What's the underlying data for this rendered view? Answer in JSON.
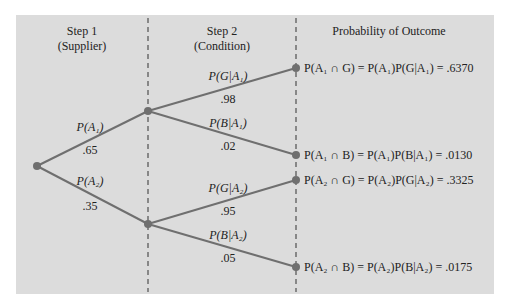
{
  "headers": {
    "step1": {
      "line1": "Step 1",
      "line2": "(Supplier)"
    },
    "step2": {
      "line1": "Step 2",
      "line2": "(Condition)"
    },
    "outcome": "Probability of Outcome"
  },
  "branches": {
    "a1": {
      "label": "P(A₁)",
      "value": ".65"
    },
    "a2": {
      "label": "P(A₂)",
      "value": ".35"
    },
    "g_a1": {
      "label": "P(G|A₁)",
      "value": ".98"
    },
    "b_a1": {
      "label": "P(B|A₁)",
      "value": ".02"
    },
    "g_a2": {
      "label": "P(G|A₂)",
      "value": ".95"
    },
    "b_a2": {
      "label": "P(B|A₂)",
      "value": ".05"
    }
  },
  "outcomes": [
    {
      "text": "P(A₁ ∩ G) = P(A₁)P(G|A₁) = .6370"
    },
    {
      "text": "P(A₁ ∩ B) = P(A₁)P(B|A₁) = .0130"
    },
    {
      "text": "P(A₂ ∩ G) = P(A₂)P(G|A₂) = .3325"
    },
    {
      "text": "P(A₂ ∩ B) = P(A₂)P(B|A₂) = .0175"
    }
  ],
  "colors": {
    "panel": "#dcdcdc",
    "line": "#6f6f6f",
    "node": "#6f6f6f"
  }
}
